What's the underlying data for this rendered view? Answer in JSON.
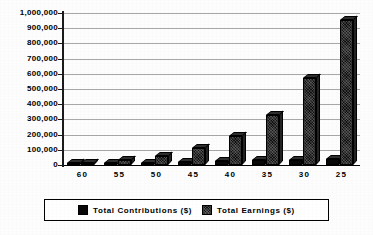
{
  "chart_data": {
    "type": "bar",
    "title": "",
    "subtitle": "",
    "xlabel": "",
    "ylabel": "",
    "categories": [
      "60",
      "55",
      "50",
      "45",
      "40",
      "35",
      "30",
      "25"
    ],
    "series": [
      {
        "name": "Total  Contributions  ($)",
        "swatch": "solid-black",
        "values": [
          3000,
          7000,
          12000,
          18000,
          24000,
          30000,
          36000,
          42000
        ]
      },
      {
        "name": "Total  Earnings  ($)",
        "swatch": "dark-hatch",
        "values": [
          10000,
          30000,
          62000,
          110000,
          190000,
          330000,
          570000,
          955000
        ]
      }
    ],
    "ylim": [
      0,
      1000000
    ],
    "ytick_step": 100000,
    "ytick_labels": [
      "1,000,000",
      "900,000",
      "800,000",
      "700,000",
      "600,000",
      "500,000",
      "400,000",
      "300,000",
      "200,000",
      "100,000",
      "0"
    ],
    "ytick_values": [
      1000000,
      900000,
      800000,
      700000,
      600000,
      500000,
      400000,
      300000,
      200000,
      100000,
      0
    ],
    "grid": true,
    "grid_axis": "y",
    "legend_position": "bottom",
    "legend_border": true,
    "style": "3d-grouped-bars-grayscale-scan",
    "colors": {
      "contributions": "#080808",
      "earnings": "#101010",
      "gridline": "#a8a8a8",
      "axis": "#1a1a1a",
      "background": "#fdfdfd",
      "text": "#000000"
    }
  }
}
